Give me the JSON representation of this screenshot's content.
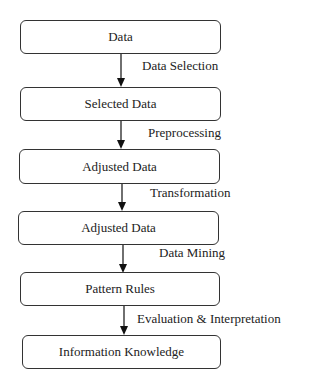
{
  "diagram": {
    "type": "flowchart",
    "direction": "top-to-bottom",
    "nodes": [
      {
        "id": "n1",
        "label": "Data"
      },
      {
        "id": "n2",
        "label": "Selected Data"
      },
      {
        "id": "n3",
        "label": "Adjusted Data"
      },
      {
        "id": "n4",
        "label": "Adjusted Data"
      },
      {
        "id": "n5",
        "label": "Pattern Rules"
      },
      {
        "id": "n6",
        "label": "Information Knowledge"
      }
    ],
    "edges": [
      {
        "from": "n1",
        "to": "n2",
        "label": "Data Selection"
      },
      {
        "from": "n2",
        "to": "n3",
        "label": "Preprocessing"
      },
      {
        "from": "n3",
        "to": "n4",
        "label": "Transformation"
      },
      {
        "from": "n4",
        "to": "n5",
        "label": "Data Mining"
      },
      {
        "from": "n5",
        "to": "n6",
        "label": "Evaluation & Interpretation"
      }
    ]
  }
}
